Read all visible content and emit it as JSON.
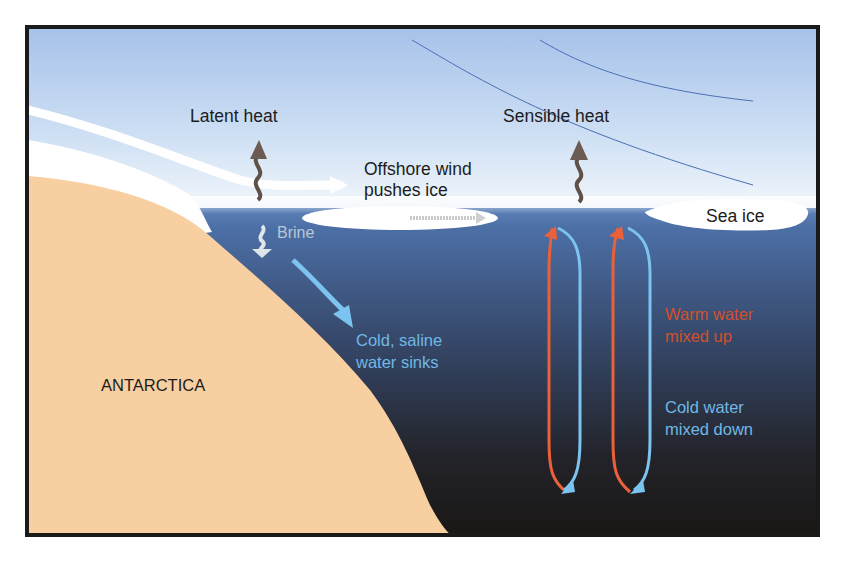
{
  "diagram": {
    "colors": {
      "sky_top": "#a9c4ea",
      "sky_bottom": "#eef4fb",
      "water_top": "#4f74ac",
      "water_bottom": "#1a1816",
      "land": "#f7cfa0",
      "ice": "#ffffff",
      "frame": "#1a1a1a",
      "warm_arrow": "#e8613a",
      "cold_arrow": "#7cc3ef",
      "heat_arrow": "#6b5b52"
    },
    "labels": {
      "latent_heat": "Latent heat",
      "sensible_heat": "Sensible heat",
      "offshore_wind_line1": "Offshore wind",
      "offshore_wind_line2": "pushes ice",
      "sea_ice": "Sea ice",
      "brine": "Brine",
      "cold_saline_line1": "Cold, saline",
      "cold_saline_line2": "water sinks",
      "antarctica": "ANTARCTICA",
      "warm_water_line1": "Warm water",
      "warm_water_line2": "mixed up",
      "cold_water_line1": "Cold water",
      "cold_water_line2": "mixed down"
    }
  }
}
